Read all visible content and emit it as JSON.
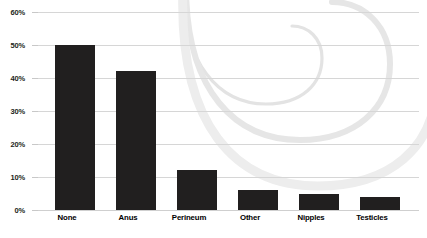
{
  "chart_data": {
    "type": "bar",
    "title": "",
    "subtitle": "",
    "xlabel": "",
    "ylabel": "",
    "categories": [
      "None",
      "Anus",
      "Perineum",
      "Other",
      "Nipples",
      "Testicles"
    ],
    "values": [
      50,
      42,
      12,
      6,
      5,
      4
    ],
    "value_suffix": "%",
    "ylim": [
      0,
      60
    ],
    "ytick_labels": [
      "0%",
      "10%",
      "20%",
      "30%",
      "40%",
      "50%",
      "60%"
    ],
    "ytick_values": [
      0,
      10,
      20,
      30,
      40,
      50,
      60
    ],
    "grid": true,
    "legend": false,
    "legend_position": "none",
    "series": [
      {
        "name": "Percent",
        "values": [
          50,
          42,
          12,
          6,
          5,
          4
        ]
      }
    ]
  },
  "style": {
    "bar_color": "#211f1f",
    "grid_color": "#d6d6d6",
    "background_color": "#ffffff",
    "label_color": "#000000",
    "watermark_color": "#e8e8e8"
  },
  "decoration": {
    "watermark_name": "spiral-swirl-watermark"
  }
}
